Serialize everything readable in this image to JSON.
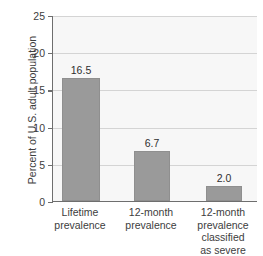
{
  "chart_data": {
    "type": "bar",
    "title": "",
    "top_clipped_text": "severe",
    "xlabel": "",
    "ylabel": "Percent of U.S. adult population",
    "categories": [
      "Lifetime\nprevalence",
      "12-month\nprevalence",
      "12-month\nprevalence\nclassified\nas severe"
    ],
    "values": [
      16.5,
      6.7,
      2.0
    ],
    "value_labels": [
      "16.5",
      "6.7",
      "2.0"
    ],
    "ylim": [
      0,
      25
    ],
    "yticks": [
      0,
      5,
      10,
      15,
      20,
      25
    ],
    "ytick_labels": [
      "0",
      "5",
      "10",
      "15",
      "20",
      "25"
    ],
    "grid": true,
    "legend": "none",
    "series": [
      {
        "name": "Prevalence",
        "values": [
          16.5,
          6.7,
          2.0
        ]
      }
    ],
    "colors": {
      "bar": "#9a9a9a",
      "bar_border": "#8f8f8f",
      "plot_background": "#f7f7f7",
      "gridline": "#d4d4d4",
      "axis": "#6e6e6e",
      "text": "#3d3d3d"
    }
  }
}
